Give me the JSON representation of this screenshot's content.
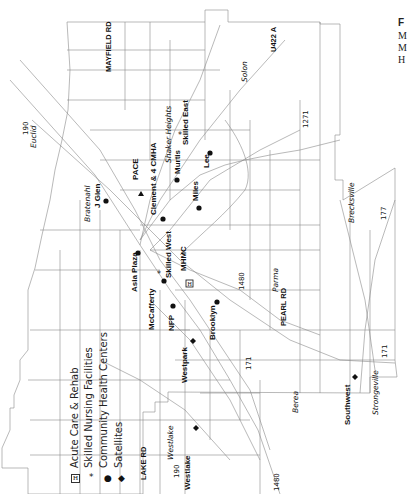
{
  "corner_text": [
    "F",
    "M",
    "M",
    "H"
  ],
  "legend": {
    "items": [
      {
        "symbol": "acute-care-icon",
        "glyph": "H",
        "label": "Acute Care & Rehab"
      },
      {
        "symbol": "skilled-nursing-icon",
        "glyph": "*",
        "label": "Skilled Nursing Facilities"
      },
      {
        "symbol": "community-health-icon",
        "glyph": "●",
        "label": "Community Health Centers"
      },
      {
        "symbol": "satellite-icon",
        "glyph": "◆",
        "label": "Satellites"
      }
    ]
  },
  "roads": {
    "mayfield": "MAYFIELD RD",
    "pearl": "PEARL RD",
    "lake": "LAKE RD",
    "u422": "U422 A"
  },
  "highways": {
    "i90_east": "190",
    "i90_west": "190",
    "i271": "1271",
    "i480_mid": "1480",
    "i480_west": "1480",
    "i71_mid": "171",
    "i71_south": "171",
    "i77": "177"
  },
  "cities": {
    "euclid": "Euclid",
    "bratenahl": "Bratenahl",
    "shaker": "Shaker Heights",
    "solon": "Solon",
    "brecksville": "Brecksville",
    "parma": "Parma",
    "berea": "Berea",
    "strongsville": "Strongeville",
    "westlake": "Westlake"
  },
  "facilities": {
    "jglen": "J Glen",
    "pace": "PACE",
    "clement": "Clement & 4 CMHA",
    "murtis": "Murtis",
    "skilled_east": "Skilled East",
    "lee": "Lee",
    "miles": "Miles",
    "skilled_west": "Skilled West",
    "mhmc": "MHMC",
    "asia": "Asia Plaza",
    "mccafferty": "McCafferty",
    "nfp": "NFP",
    "brooklyn": "Brooklyn",
    "westpark": "Westpark",
    "westlake": "Westlake",
    "southwest": "Southwest"
  }
}
